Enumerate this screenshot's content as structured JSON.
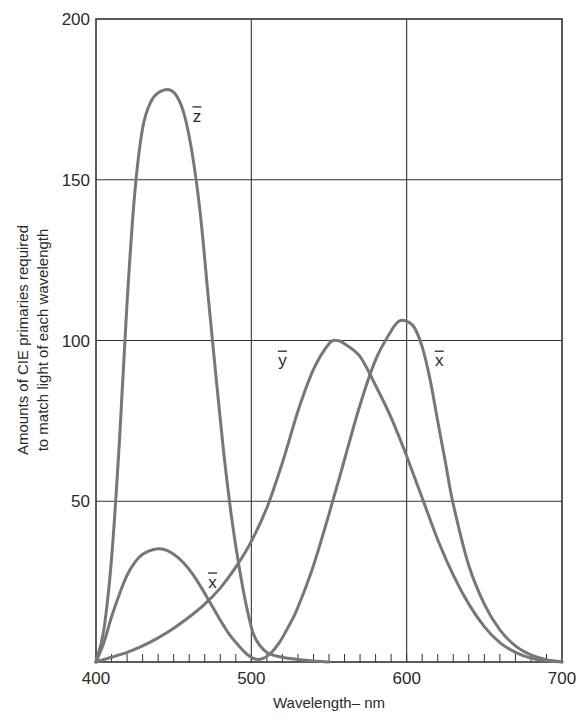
{
  "chart_data": {
    "type": "line",
    "title": "",
    "xlabel": "Wavelength– nm",
    "ylabel_lines": [
      "Amounts of CIE primaries required",
      "to match light of each wavelength"
    ],
    "ylabel": "Amounts of CIE primaries required to match light of each wavelength",
    "xlim": [
      400,
      700
    ],
    "ylim": [
      0,
      200
    ],
    "x_ticks": [
      400,
      500,
      600,
      700
    ],
    "y_ticks": [
      50,
      100,
      150,
      200
    ],
    "x_minor_tick_step": 10,
    "grid": true,
    "legend": "inline labels",
    "colors": {
      "curve": "#777777",
      "grid": "#333333",
      "frame": "#333333",
      "text": "#2a2a2a"
    },
    "series": [
      {
        "name": "z̄",
        "label": "z",
        "label_pos": {
          "x": 465,
          "y": 168
        },
        "points": [
          [
            400,
            0
          ],
          [
            405,
            10
          ],
          [
            410,
            32
          ],
          [
            415,
            68
          ],
          [
            420,
            112
          ],
          [
            425,
            146
          ],
          [
            430,
            166
          ],
          [
            435,
            174
          ],
          [
            440,
            177
          ],
          [
            447,
            178
          ],
          [
            452,
            176
          ],
          [
            457,
            170
          ],
          [
            462,
            158
          ],
          [
            467,
            140
          ],
          [
            472,
            115
          ],
          [
            477,
            90
          ],
          [
            482,
            66
          ],
          [
            487,
            46
          ],
          [
            492,
            30
          ],
          [
            497,
            17
          ],
          [
            502,
            8
          ],
          [
            510,
            3
          ],
          [
            520,
            1.5
          ],
          [
            530,
            0.8
          ],
          [
            540,
            0.3
          ],
          [
            550,
            0
          ]
        ]
      },
      {
        "name": "ȳ",
        "label": "y",
        "label_pos": {
          "x": 520,
          "y": 92
        },
        "points": [
          [
            400,
            0
          ],
          [
            410,
            1.5
          ],
          [
            420,
            3
          ],
          [
            430,
            5
          ],
          [
            440,
            7.5
          ],
          [
            450,
            10.5
          ],
          [
            460,
            14
          ],
          [
            470,
            18
          ],
          [
            480,
            23
          ],
          [
            490,
            29.5
          ],
          [
            500,
            37.5
          ],
          [
            510,
            48
          ],
          [
            520,
            62
          ],
          [
            530,
            78
          ],
          [
            540,
            91
          ],
          [
            550,
            99
          ],
          [
            555,
            100
          ],
          [
            560,
            99
          ],
          [
            570,
            95
          ],
          [
            580,
            86
          ],
          [
            590,
            76
          ],
          [
            600,
            64
          ],
          [
            610,
            51
          ],
          [
            620,
            38
          ],
          [
            630,
            27
          ],
          [
            640,
            18
          ],
          [
            650,
            11
          ],
          [
            660,
            6
          ],
          [
            670,
            3
          ],
          [
            680,
            1.2
          ],
          [
            690,
            0.4
          ],
          [
            700,
            0
          ]
        ]
      },
      {
        "name": "x̄",
        "label": "x",
        "label_pos": {
          "x": 621,
          "y": 92
        },
        "label2_pos": {
          "x": 475,
          "y": 23
        },
        "points": [
          [
            400,
            0
          ],
          [
            405,
            6
          ],
          [
            410,
            14
          ],
          [
            415,
            21
          ],
          [
            420,
            27
          ],
          [
            425,
            31
          ],
          [
            430,
            33.5
          ],
          [
            437,
            35
          ],
          [
            444,
            35
          ],
          [
            450,
            33.5
          ],
          [
            456,
            31
          ],
          [
            462,
            27.5
          ],
          [
            468,
            23
          ],
          [
            474,
            18
          ],
          [
            480,
            13
          ],
          [
            486,
            8.5
          ],
          [
            492,
            5
          ],
          [
            497,
            2.5
          ],
          [
            502,
            1
          ],
          [
            507,
            1
          ],
          [
            512,
            2.5
          ],
          [
            518,
            6
          ],
          [
            525,
            12
          ],
          [
            530,
            17
          ],
          [
            540,
            30
          ],
          [
            550,
            46
          ],
          [
            560,
            63
          ],
          [
            570,
            80
          ],
          [
            580,
            94
          ],
          [
            590,
            103
          ],
          [
            595,
            106
          ],
          [
            600,
            106
          ],
          [
            605,
            104
          ],
          [
            610,
            98
          ],
          [
            615,
            88
          ],
          [
            620,
            75
          ],
          [
            625,
            62
          ],
          [
            630,
            49
          ],
          [
            640,
            30
          ],
          [
            650,
            18
          ],
          [
            660,
            10
          ],
          [
            670,
            5
          ],
          [
            680,
            2.2
          ],
          [
            690,
            0.7
          ],
          [
            700,
            0
          ]
        ]
      }
    ]
  }
}
